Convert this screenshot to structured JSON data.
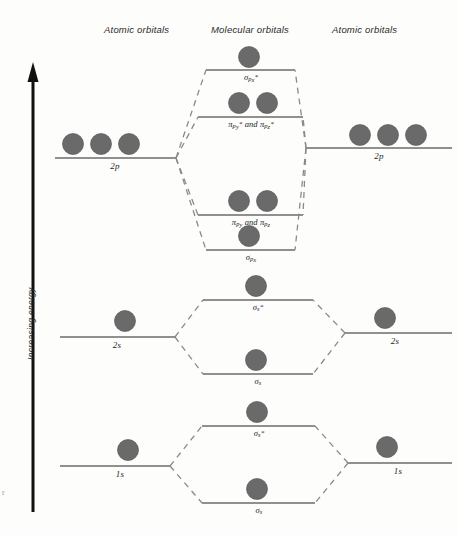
{
  "colors": {
    "orbital_fill": "#6a6a6a",
    "orbital_stroke": "#5a5a5a",
    "level_line": "#6b6b6b",
    "dashed_line": "#8a8a8a",
    "axis": "#111111",
    "text": "#242424",
    "background": "#fdfdfc"
  },
  "headers": {
    "left": "Atomic orbitals",
    "center": "Molecular orbitals",
    "right": "Atomic orbitals"
  },
  "axis": {
    "label": "Increasing energy",
    "direction": "up"
  },
  "edge_artifact": "r",
  "chart_data": {
    "type": "diagram",
    "xlabel": "",
    "ylabel": "Increasing energy",
    "grid": false,
    "legend": "none",
    "columns": [
      "Atomic orbitals",
      "Molecular orbitals",
      "Atomic orbitals"
    ],
    "atomic_levels": [
      {
        "name": "2p",
        "side": "left",
        "electrons": 3,
        "y": 158
      },
      {
        "name": "2p",
        "side": "right",
        "electrons": 3,
        "y": 148
      },
      {
        "name": "2s",
        "side": "left",
        "electrons": 1,
        "y": 337
      },
      {
        "name": "2s",
        "side": "right",
        "electrons": 1,
        "y": 333
      },
      {
        "name": "1s",
        "side": "left",
        "electrons": 1,
        "y": 466
      },
      {
        "name": "1s",
        "side": "right",
        "electrons": 1,
        "y": 463
      }
    ],
    "molecular_levels": [
      {
        "name": "sigma_px_star",
        "label_html": "σ<sub>p<sub>x</sub></sub><sup>*</sup>",
        "electrons": 1,
        "y": 70
      },
      {
        "name": "pi_py_pz_star",
        "label_html": "π<sub>p<sub>y</sub></sub><sup>*</sup> and π<sub>p<sub>z</sub></sub><sup>*</sup>",
        "electrons": 2,
        "y": 117
      },
      {
        "name": "pi_py_pz",
        "label_html": "π<sub>p<sub>y</sub></sub> and π<sub>p<sub>z</sub></sub>",
        "electrons": 2,
        "y": 215
      },
      {
        "name": "sigma_px",
        "label_html": "σ<sub>p<sub>x</sub></sub>",
        "electrons": 1,
        "y": 250
      },
      {
        "name": "sigma_s_star_2s",
        "label_html": "σ<sub>s</sub><sup>*</sup>",
        "electrons": 1,
        "y": 300
      },
      {
        "name": "sigma_s_2s",
        "label_html": "σ<sub>s</sub>",
        "electrons": 1,
        "y": 374
      },
      {
        "name": "sigma_s_star_1s",
        "label_html": "σ<sub>s</sub><sup>*</sup>",
        "electrons": 1,
        "y": 426
      },
      {
        "name": "sigma_s_1s",
        "label_html": "σ<sub>s</sub>",
        "electrons": 1,
        "y": 503
      }
    ],
    "level_labels": {
      "p_left": "2p",
      "p_right": "2p",
      "s2_left": "2s",
      "s2_right": "2s",
      "s1_left": "1s",
      "s1_right": "1s"
    }
  }
}
